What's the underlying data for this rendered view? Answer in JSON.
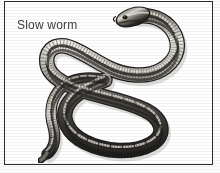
{
  "figure": {
    "caption": "Slow worm",
    "style": "grayscale-illustration-plate",
    "background_color": "#ffffff",
    "border_color": "#2b2b2b",
    "caption_color": "#3c3c40",
    "body_colors": {
      "dark": "#2e2c29",
      "mid": "#6f6c66",
      "light": "#c9c6bf",
      "highlight": "#efece6"
    }
  }
}
